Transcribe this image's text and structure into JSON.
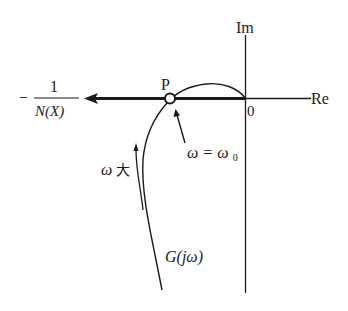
{
  "figure": {
    "type": "nyquist-describing-function-plot",
    "axes": {
      "imag_label": "Im",
      "real_label": "Re",
      "origin_label": "0"
    },
    "curves": {
      "g_label": "G(jω)",
      "neg_inv_n_minus": "−",
      "neg_inv_n_numerator": "1",
      "neg_inv_n_denominator": "N(X)"
    },
    "intersection": {
      "point_label": "P",
      "frequency_label": "ω = ω₀",
      "freq_omega": "ω",
      "freq_eq": "=",
      "freq_omega0": "ω",
      "freq_sub": "0"
    },
    "direction": {
      "label_omega": "ω",
      "label_big": "大"
    },
    "colors": {
      "ink": "#1a1a1a",
      "background": "#ffffff"
    }
  }
}
